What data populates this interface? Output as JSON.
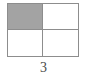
{
  "figure": {
    "type": "fraction-area-model",
    "caption": "3",
    "grid": {
      "rows": 2,
      "columns": 2,
      "total_cells": 4,
      "shaded_cells": 1,
      "cells": [
        {
          "row": 0,
          "column": 0,
          "state": "shaded"
        },
        {
          "row": 0,
          "column": 1,
          "state": "unshaded"
        },
        {
          "row": 1,
          "column": 0,
          "state": "unshaded"
        },
        {
          "row": 1,
          "column": 1,
          "state": "unshaded"
        }
      ]
    },
    "colors": {
      "shaded_fill": "#a3a3a3",
      "unshaded_fill": "#ffffff",
      "border": "#8d8d8d",
      "caption_text": "#4a4a4a",
      "background": "#ffffff"
    }
  }
}
